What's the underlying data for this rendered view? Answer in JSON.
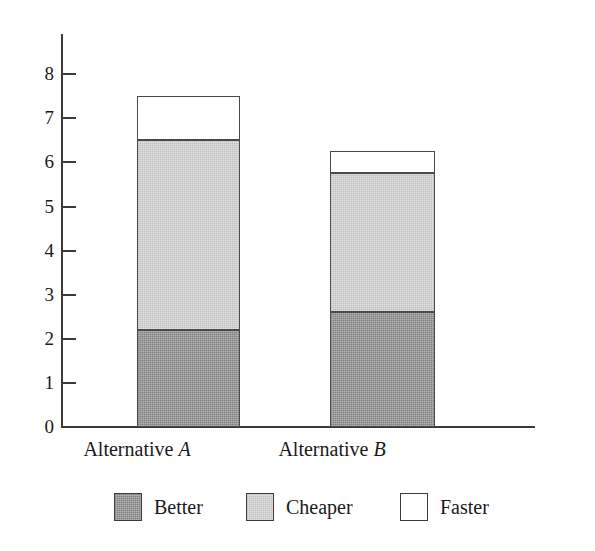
{
  "chart_data": {
    "type": "bar",
    "subtype": "stacked-bar",
    "title": "",
    "xlabel": "",
    "ylabel": "",
    "categories": [
      "Alternative A",
      "Alternative B"
    ],
    "category_emphasis": [
      "A",
      "B"
    ],
    "series": [
      {
        "name": "Better",
        "values": [
          2.2,
          2.6
        ],
        "color": "#8d8d8d"
      },
      {
        "name": "Cheaper",
        "values": [
          4.3,
          3.15
        ],
        "color": "#d2d2d2"
      },
      {
        "name": "Faster",
        "values": [
          1.0,
          0.5
        ],
        "color": "#ffffff"
      }
    ],
    "totals": [
      7.5,
      6.25
    ],
    "ylim": [
      0,
      8.9
    ],
    "yticks": [
      0,
      1,
      2,
      3,
      4,
      5,
      6,
      7,
      8
    ],
    "ytick_labels": [
      "0",
      "1",
      "2",
      "3",
      "4",
      "5",
      "6",
      "7",
      "8"
    ],
    "grid": false,
    "legend_position": "bottom",
    "legend_entries": [
      "Better",
      "Cheaper",
      "Faster"
    ],
    "axis_color": "#3a3a3a",
    "bar_edge_color": "#4a4a4a",
    "background": "#ffffff"
  },
  "axis": {
    "ticks": [
      {
        "label": "8",
        "value": 8
      },
      {
        "label": "7",
        "value": 7
      },
      {
        "label": "6",
        "value": 6
      },
      {
        "label": "5",
        "value": 5
      },
      {
        "label": "4",
        "value": 4
      },
      {
        "label": "3",
        "value": 3
      },
      {
        "label": "2",
        "value": 2
      },
      {
        "label": "1",
        "value": 1
      },
      {
        "label": "0",
        "value": 0
      }
    ]
  },
  "bars": [
    {
      "category_prefix": "Alternative ",
      "category_letter": "A",
      "segments": [
        {
          "name": "Faster",
          "value": 1.0
        },
        {
          "name": "Cheaper",
          "value": 4.3
        },
        {
          "name": "Better",
          "value": 2.2
        }
      ]
    },
    {
      "category_prefix": "Alternative ",
      "category_letter": "B",
      "segments": [
        {
          "name": "Faster",
          "value": 0.5
        },
        {
          "name": "Cheaper",
          "value": 3.15
        },
        {
          "name": "Better",
          "value": 2.6
        }
      ]
    }
  ],
  "legend": {
    "items": [
      {
        "label": "Better",
        "swatch": "dark-gray"
      },
      {
        "label": "Cheaper",
        "swatch": "light-gray"
      },
      {
        "label": "Faster",
        "swatch": "white"
      }
    ]
  }
}
